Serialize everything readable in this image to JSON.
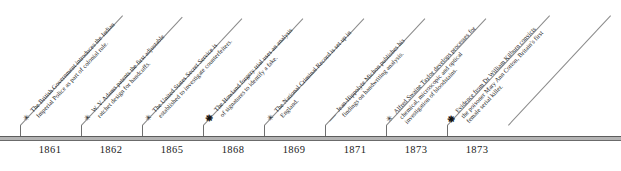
{
  "chart_data": {
    "type": "timeline",
    "title": "",
    "orientation": "horizontal",
    "axis": {
      "grid": false,
      "tick_labels": [
        "1861",
        "1862",
        "1865",
        "1868",
        "1869",
        "1871",
        "1873",
        "1873"
      ]
    },
    "events": [
      {
        "year": "1861",
        "marker": "asterisk",
        "marker_glyph": "✳",
        "text": "The British Government introduces the Indian Imperial Police as part of colonial rule."
      },
      {
        "year": "1862",
        "marker": "asterisk",
        "marker_glyph": "✳",
        "text": "W. V. Adams patents the first adjustable ratchet design for handcuffs."
      },
      {
        "year": "1865",
        "marker": "asterisk",
        "marker_glyph": "✳",
        "text": "The United States Secret Service is established to investigate counterfeiters."
      },
      {
        "year": "1868",
        "marker": "filled-dot",
        "marker_glyph": "❋",
        "text": "The Howland forgery trial uses an analysis of signatures to identify a fake."
      },
      {
        "year": "1869",
        "marker": "asterisk",
        "marker_glyph": "✳",
        "text": "The National Criminal Record is set up in England."
      },
      {
        "year": "1871",
        "marker": "dash",
        "marker_glyph": "—",
        "text": "Jean-Hippolyte Michon publishes his findings on handwriting analysis."
      },
      {
        "year": "1873",
        "marker": "asterisk",
        "marker_glyph": "✳",
        "text": "Alfred Swaine Taylor develops processes for chemical, microscopic and optical investigation of bloodstains."
      },
      {
        "year": "1873",
        "marker": "filled-dot",
        "marker_glyph": "❋",
        "text": "Evidence from Dr William Kilburn convicts the poisoner Mary Ann Cotton, Britain's first female serial killer."
      }
    ]
  },
  "colors": {
    "axis": "#6b6b6b",
    "axis_band": "#b4b4b4",
    "leader": "#8a8a8a",
    "text": "#1c1c1c"
  }
}
